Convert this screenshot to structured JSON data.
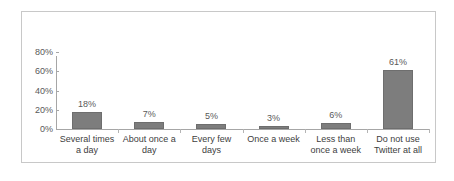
{
  "chart_data": {
    "type": "bar",
    "title": "",
    "xlabel": "",
    "ylabel": "",
    "categories": [
      "Several times\na day",
      "About once a\nday",
      "Every few\ndays",
      "Once a week",
      "Less than\nonce a week",
      "Do not use\nTwitter at all"
    ],
    "values": [
      18,
      7,
      5,
      3,
      6,
      61
    ],
    "value_labels": [
      "18%",
      "7%",
      "5%",
      "3%",
      "6%",
      "61%"
    ],
    "ylim": [
      0,
      80
    ],
    "yticks": [
      0,
      20,
      40,
      60,
      80
    ],
    "ytick_labels": [
      "0%",
      "20%",
      "40%",
      "60%",
      "80%"
    ],
    "grid": false,
    "legend": false,
    "legend_position": "none",
    "bar_color": "#7d7d7d",
    "axis_color": "#a6a6a6",
    "text_color": "#595959",
    "frame_color": "#c8c8c8",
    "background": "#ffffff"
  }
}
